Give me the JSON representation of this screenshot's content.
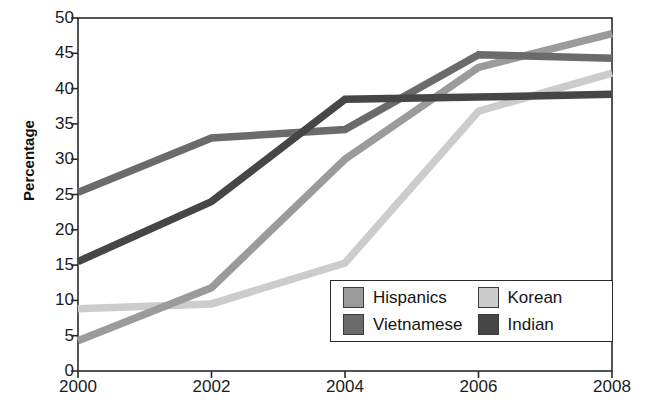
{
  "chart_data": {
    "type": "line",
    "title": "",
    "xlabel": "",
    "ylabel": "Percentage",
    "x": [
      2000,
      2002,
      2004,
      2006,
      2008
    ],
    "xtick_labels": [
      "2000",
      "2002",
      "2004",
      "2006",
      "2008"
    ],
    "ytick_labels": [
      "0",
      "5",
      "10",
      "15",
      "20",
      "25",
      "30",
      "35",
      "40",
      "45",
      "50"
    ],
    "yticks": [
      0,
      5,
      10,
      15,
      20,
      25,
      30,
      35,
      40,
      45,
      50
    ],
    "xlim": [
      2000,
      2008
    ],
    "ylim": [
      0,
      50
    ],
    "grid": false,
    "legend_position": "lower-right-inside",
    "series": [
      {
        "name": "Hispanics",
        "color": "#9b9b9b",
        "values": [
          4.3,
          11.8,
          30.0,
          43.0,
          47.8
        ]
      },
      {
        "name": "Korean",
        "color": "#cccccc",
        "values": [
          8.8,
          9.5,
          15.3,
          36.8,
          42.2
        ]
      },
      {
        "name": "Vietnamese",
        "color": "#6b6b6b",
        "values": [
          25.3,
          33.0,
          34.2,
          44.8,
          44.3
        ]
      },
      {
        "name": "Indian",
        "color": "#464646",
        "values": [
          15.5,
          24.0,
          38.5,
          38.8,
          39.2
        ]
      }
    ]
  },
  "legend": {
    "items": [
      {
        "label": "Hispanics",
        "color": "#9b9b9b"
      },
      {
        "label": "Korean",
        "color": "#cccccc"
      },
      {
        "label": "Vietnamese",
        "color": "#6b6b6b"
      },
      {
        "label": "Indian",
        "color": "#464646"
      }
    ]
  },
  "axes": {
    "frame_color": "#2a2a2a"
  }
}
